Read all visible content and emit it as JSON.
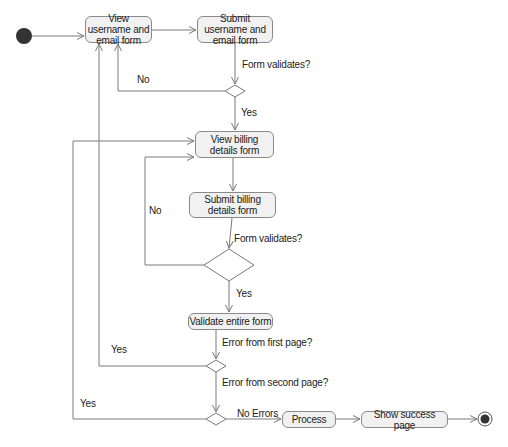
{
  "diagram": {
    "type": "UML activity diagram",
    "colors": {
      "line": "#7a7a7a",
      "node_fill": "#f1f1f1",
      "node_border": "#8a8a8a",
      "start_end": "#333333"
    },
    "nodes": {
      "start": {
        "label": ""
      },
      "view_username": {
        "label": "View username and email form"
      },
      "submit_username": {
        "label": "Submit username and email form"
      },
      "view_billing": {
        "label": "View billing details form"
      },
      "submit_billing": {
        "label": "Submit billing details form"
      },
      "validate_entire": {
        "label": "Validate entire form"
      },
      "process": {
        "label": "Process"
      },
      "show_success": {
        "label": "Show success page"
      },
      "end": {
        "label": ""
      }
    },
    "labels": {
      "form_validates_1": "Form validates?",
      "no_1": "No",
      "yes_1": "Yes",
      "form_validates_2": "Form validates?",
      "no_2": "No",
      "yes_2": "Yes",
      "error_first_page": "Error from first page?",
      "yes_first": "Yes",
      "error_second_page": "Error from second page?",
      "yes_second": "Yes",
      "no_errors": "No Errors"
    },
    "edges": [
      {
        "from": "start",
        "to": "view_username"
      },
      {
        "from": "view_username",
        "to": "submit_username"
      },
      {
        "from": "submit_username",
        "to": "decision_1",
        "label": "Form validates?"
      },
      {
        "from": "decision_1",
        "to": "view_username",
        "label": "No"
      },
      {
        "from": "decision_1",
        "to": "view_billing",
        "label": "Yes"
      },
      {
        "from": "view_billing",
        "to": "submit_billing"
      },
      {
        "from": "submit_billing",
        "to": "decision_2",
        "label": "Form validates?"
      },
      {
        "from": "decision_2",
        "to": "view_billing",
        "label": "No"
      },
      {
        "from": "decision_2",
        "to": "validate_entire",
        "label": "Yes"
      },
      {
        "from": "validate_entire",
        "to": "decision_3",
        "label": "Error from first page?"
      },
      {
        "from": "decision_3",
        "to": "view_username",
        "label": "Yes"
      },
      {
        "from": "decision_3",
        "to": "decision_4",
        "label": "Error from second page?"
      },
      {
        "from": "decision_4",
        "to": "view_billing",
        "label": "Yes"
      },
      {
        "from": "decision_4",
        "to": "process",
        "label": "No Errors"
      },
      {
        "from": "process",
        "to": "show_success"
      },
      {
        "from": "show_success",
        "to": "end"
      }
    ]
  }
}
